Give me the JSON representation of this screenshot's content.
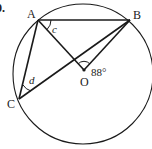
{
  "figure": {
    "question_number": "0.",
    "points": [
      {
        "label": "A",
        "x": 38,
        "y": 20
      },
      {
        "label": "B",
        "x": 130,
        "y": 20
      },
      {
        "label": "C",
        "x": 19,
        "y": 99
      },
      {
        "label": "O",
        "x": 84,
        "y": 70
      }
    ],
    "circle": {
      "cx": 83,
      "cy": 74,
      "r": 70,
      "center_label": "O"
    },
    "segments": [
      "AB",
      "AC",
      "AO",
      "BO",
      "BC"
    ],
    "angles": [
      {
        "label": "c",
        "vertex": "A",
        "between": [
          "AB",
          "AO"
        ]
      },
      {
        "label": "d",
        "vertex": "C",
        "between": [
          "CA",
          "CB"
        ]
      },
      {
        "label": "88°",
        "vertex": "O",
        "between": [
          "OA",
          "OB"
        ]
      }
    ],
    "labels": {
      "A": "A",
      "B": "B",
      "C": "C",
      "O": "O",
      "angle_c": "c",
      "angle_d": "d",
      "angle_o": "88°",
      "qnum": "0."
    },
    "stroke_color": "#1a1a1a"
  }
}
